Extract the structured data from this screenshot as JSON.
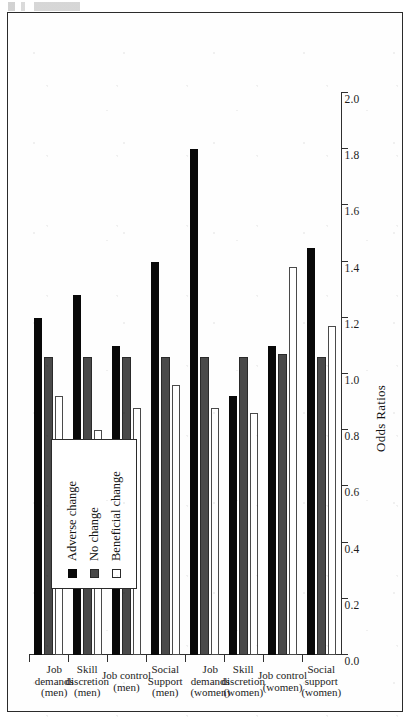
{
  "figure": {
    "value_axis_title": "Odds Ratios"
  },
  "legend": {
    "items": [
      {
        "key": "adverse",
        "label": "Adverse change",
        "swatch": "filled-black-square",
        "color": "#090909"
      },
      {
        "key": "nochange",
        "label": "No change",
        "swatch": "filled-gray-square",
        "color": "#4a4a4a"
      },
      {
        "key": "beneficial",
        "label": "Beneficial change",
        "swatch": "open-white-square",
        "color": "#ffffff"
      }
    ]
  },
  "chart_data": {
    "type": "bar",
    "orientation": "horizontal",
    "title": "",
    "xlabel": "Odds Ratios",
    "ylabel": "",
    "xlim": [
      0.0,
      2.0
    ],
    "xticks": [
      "0.0",
      "0.2",
      "0.4",
      "0.6",
      "0.8",
      "1.0",
      "1.2",
      "1.4",
      "1.6",
      "1.8",
      "2.0"
    ],
    "grid": false,
    "legend_position": "upper-left-inset",
    "categories": [
      "Social support (women)",
      "Job control (women)",
      "Skill discretion (women)",
      "Job demands (women)",
      "Social Support (men)",
      "Job control (men)",
      "Skill discretion (men)",
      "Job demands (men)"
    ],
    "category_labels": [
      [
        "Social",
        "support",
        "(women)"
      ],
      [
        "Job control",
        "(women)"
      ],
      [
        "Skill",
        "discretion",
        "(women)"
      ],
      [
        "Job demands",
        "(women)"
      ],
      [
        "Social",
        "Support",
        "(men)"
      ],
      [
        "Job control",
        "(men)"
      ],
      [
        "Skill",
        "discretion",
        "(men)"
      ],
      [
        "Job demands",
        "(men)"
      ]
    ],
    "series": [
      {
        "name": "Adverse change",
        "key": "adverse",
        "values": [
          1.45,
          1.1,
          0.92,
          1.8,
          1.4,
          1.1,
          1.28,
          1.2
        ]
      },
      {
        "name": "No change",
        "key": "nochange",
        "values": [
          1.06,
          1.07,
          1.06,
          1.06,
          1.06,
          1.06,
          1.06,
          1.06
        ]
      },
      {
        "name": "Beneficial change",
        "key": "beneficial",
        "values": [
          1.17,
          1.38,
          0.86,
          0.88,
          0.96,
          0.88,
          0.8,
          0.92
        ]
      }
    ]
  }
}
